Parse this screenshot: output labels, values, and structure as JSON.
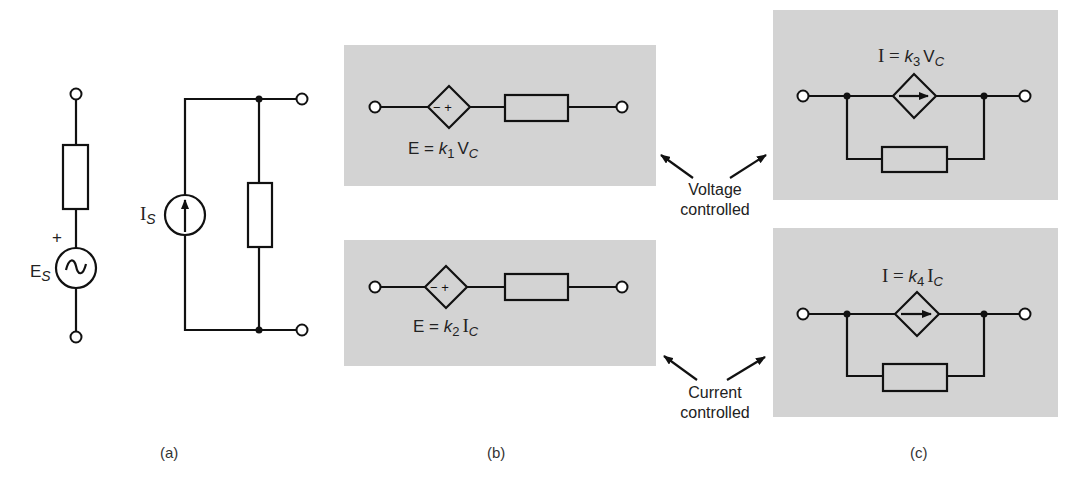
{
  "figure": {
    "panel_a": {
      "caption": "(a)",
      "voltage_source": {
        "symbol": "E",
        "subscript": "S",
        "polarity": "+",
        "glyph": "~"
      },
      "current_source": {
        "symbol": "I",
        "subscript": "S"
      }
    },
    "panel_b": {
      "caption": "(b)",
      "voltage_controlled": {
        "lhs": "E = ",
        "k": "k",
        "k_sub": "1",
        "ctrl": "V",
        "ctrl_sub": "C",
        "signs": "− +"
      },
      "current_controlled": {
        "lhs": "E = ",
        "k": "k",
        "k_sub": "2",
        "ctrl": "I",
        "ctrl_sub": "C",
        "signs": "− +"
      }
    },
    "panel_c": {
      "caption": "(c)",
      "voltage_controlled": {
        "lhs": "I = ",
        "k": "k",
        "k_sub": "3",
        "ctrl": "V",
        "ctrl_sub": "C"
      },
      "current_controlled": {
        "lhs": "I = ",
        "k": "k",
        "k_sub": "4",
        "ctrl": "I",
        "ctrl_sub": "C"
      }
    },
    "annotations": {
      "voltage": {
        "line1": "Voltage",
        "line2": "controlled"
      },
      "current": {
        "line1": "Current",
        "line2": "controlled"
      }
    },
    "colors": {
      "panel_bg": "#d3d3d3",
      "ink": "#111111"
    }
  }
}
